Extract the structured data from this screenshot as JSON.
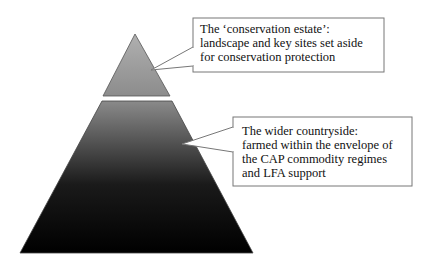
{
  "diagram": {
    "type": "pyramid",
    "tiers": [
      {
        "id": "conservation-estate",
        "callout_lines": [
          "The ‘conservation estate’:",
          "landscape and key sites set aside",
          "for conservation protection"
        ]
      },
      {
        "id": "wider-countryside",
        "callout_lines": [
          "The wider countryside:",
          "farmed within the envelope of",
          "the CAP commodity regimes",
          "and LFA support"
        ]
      }
    ],
    "colors": {
      "top_tier": "#9a9a9a",
      "bottom_tier_top": "#8a8a8a",
      "bottom_tier_bottom": "#000000",
      "callout_border": "#777777"
    }
  }
}
